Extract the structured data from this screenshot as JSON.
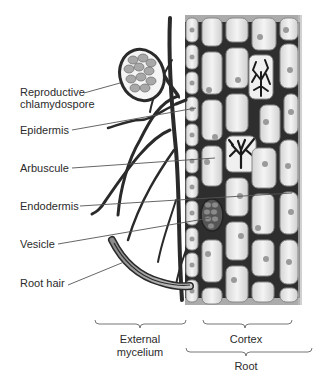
{
  "labels": {
    "reproductive_line1": "Reproductive",
    "reproductive_line2": "chlamydospore",
    "epidermis": "Epidermis",
    "arbuscule": "Arbuscule",
    "endodermis": "Endodermis",
    "vesicle": "Vesicle",
    "root_hair": "Root hair"
  },
  "brackets": {
    "external_line1": "External",
    "external_line2": "mycelium",
    "cortex": "Cortex",
    "root": "Root"
  },
  "colors": {
    "hyphae": "#2a2a2a",
    "cell_wall": "#3a3a3a",
    "cell_fill": "#e6e6e6",
    "nucleus": "#9a9a9a",
    "leader_line": "#555555",
    "spore_fill": "#a8a8a8"
  }
}
